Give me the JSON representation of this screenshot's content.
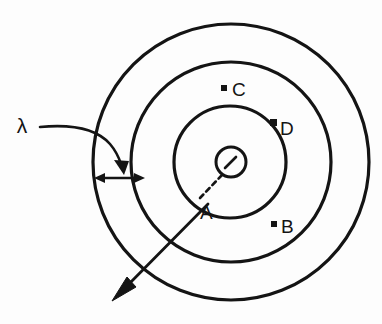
{
  "figure": {
    "background_color": "#fdfdfd",
    "stroke_color": "#141414",
    "canvas": {
      "width": 382,
      "height": 324
    }
  },
  "center": {
    "x": 231,
    "y": 162,
    "marker_name": "center-source-circle",
    "marker_radius": 15,
    "tick_name": "center-tick-mark"
  },
  "circles": [
    {
      "name": "outer-circle",
      "label": "outer shell",
      "cx": 231,
      "cy": 162,
      "r": 138
    },
    {
      "name": "middle-circle",
      "label": "middle shell",
      "cx": 231,
      "cy": 162,
      "r": 100
    },
    {
      "name": "inner-circle",
      "label": "inner shell",
      "cx": 230,
      "cy": 162,
      "r": 56
    }
  ],
  "annotations": {
    "wavelength": {
      "symbol": "λ",
      "name": "wavelength-label",
      "x": 22,
      "y": 133,
      "leader_name": "wavelength-leader-line",
      "gap_arrow_name": "wavelength-gap-arrow"
    },
    "ray": {
      "name": "propagation-ray-arrow",
      "from_x": 208,
      "from_y": 204,
      "to_x": 116,
      "to_y": 297
    },
    "radius_dash": {
      "name": "center-to-a-dashed-line",
      "from_x": 222,
      "from_y": 175,
      "to_x": 200,
      "to_y": 198
    }
  },
  "points": [
    {
      "id": "C",
      "label": "C",
      "name": "point-c",
      "dot_x": 224,
      "dot_y": 88,
      "text_x": 233,
      "text_y": 96,
      "region": "middle annulus"
    },
    {
      "id": "D",
      "label": "D",
      "name": "point-d",
      "dot_x": 273,
      "dot_y": 123,
      "text_x": 280,
      "text_y": 134,
      "region": "inner shell edge"
    },
    {
      "id": "A",
      "label": "A",
      "name": "point-a",
      "dot_x": null,
      "dot_y": null,
      "text_x": 205,
      "text_y": 216,
      "region": "inner shell edge"
    },
    {
      "id": "B",
      "label": "B",
      "name": "point-b",
      "dot_x": 274,
      "dot_y": 224,
      "text_x": 282,
      "text_y": 232,
      "region": "outer annulus"
    }
  ]
}
